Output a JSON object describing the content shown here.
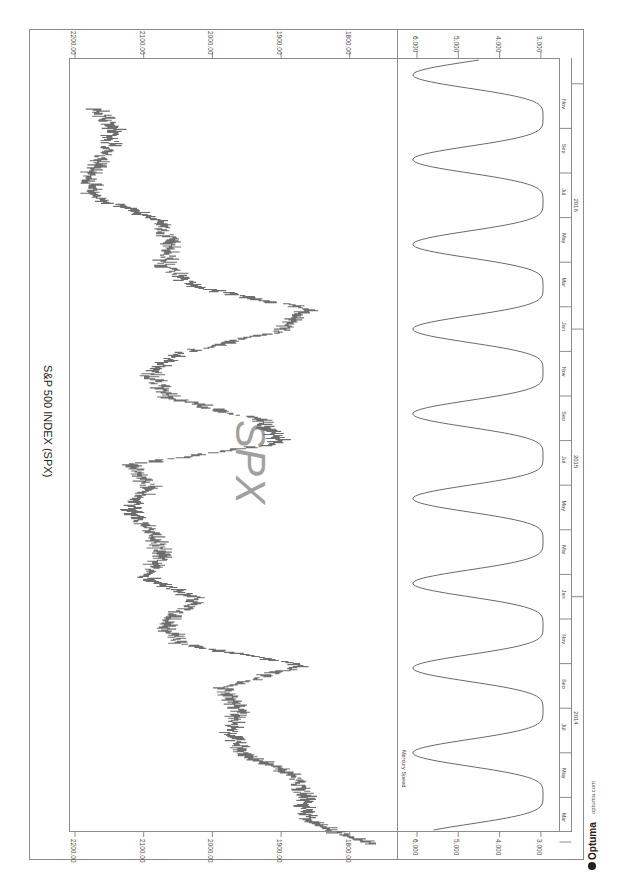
{
  "chart_data": {
    "type": "line",
    "orientation": "rotated-90-clockwise",
    "title": "S&P 500 INDEX (SPX)",
    "watermark": "SPX",
    "panels": [
      {
        "name": "price",
        "series_name": "SPX",
        "style": "OHLC bars",
        "ylabel": "",
        "yticks": [
          "2200.00",
          "2100.00",
          "2000.00",
          "1900.00",
          "1800.00"
        ],
        "ylim": [
          1780,
          2210
        ],
        "x": [
          "2014-02",
          "2014-03",
          "2014-04",
          "2014-05",
          "2014-06",
          "2014-07",
          "2014-08",
          "2014-09",
          "2014-10",
          "2014-11",
          "2014-12",
          "2015-01",
          "2015-02",
          "2015-03",
          "2015-04",
          "2015-05",
          "2015-06",
          "2015-07",
          "2015-08",
          "2015-09",
          "2015-10",
          "2015-11",
          "2015-12",
          "2016-01",
          "2016-02",
          "2016-03",
          "2016-04",
          "2016-05",
          "2016-06",
          "2016-07",
          "2016-08",
          "2016-09",
          "2016-10",
          "2016-11"
        ],
        "values": [
          1770,
          1860,
          1865,
          1880,
          1950,
          1975,
          1960,
          1985,
          1870,
          2050,
          2070,
          2020,
          2100,
          2070,
          2090,
          2120,
          2090,
          2120,
          1900,
          1930,
          2060,
          2090,
          2050,
          1900,
          1860,
          2030,
          2070,
          2060,
          2080,
          2170,
          2180,
          2155,
          2140,
          2170
        ]
      },
      {
        "name": "mercury",
        "label": "Mercury Speed",
        "yticks": [
          "6.000",
          "5.000",
          "4.000",
          "3.000"
        ],
        "ylim": [
          2.8,
          6.3
        ],
        "note": "Oscillating planetary speed curve, ~4 month period, peaks ~6.1, troughs ~2.9"
      }
    ],
    "time_axis": {
      "months": [
        "Mar",
        "May",
        "Jul",
        "Sep",
        "Nov",
        "Jan",
        "Mar",
        "May",
        "Jul",
        "Sep",
        "Nov",
        "Jan",
        "Mar",
        "May",
        "Jul",
        "Sep",
        "Nov"
      ],
      "years": [
        "2014",
        "2015",
        "2016"
      ]
    },
    "grid": false,
    "legend": "none"
  },
  "footer": {
    "brand": "Optuma",
    "url": "optuma.com"
  },
  "colors": {
    "bars": "#6e6e6e",
    "bars_light": "#a8a8a8",
    "frame": "#8c8c8c",
    "watermark": "#a0a0a0",
    "text": "#444444"
  }
}
